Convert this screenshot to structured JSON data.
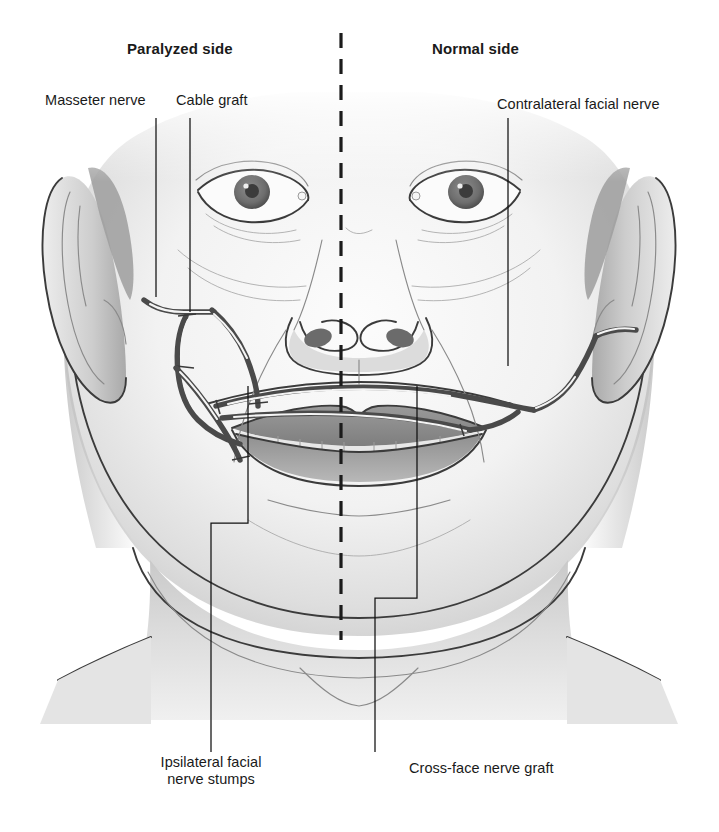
{
  "figure": {
    "kind": "medical-illustration",
    "midline_label": "facial-midline-dashed"
  },
  "headings": {
    "left": "Paralyzed side",
    "right": "Normal side"
  },
  "labels": {
    "masseter_nerve": "Masseter nerve",
    "cable_graft": "Cable graft",
    "contralateral_facial_nerve": "Contralateral facial nerve",
    "ipsilateral_stumps_line1": "Ipsilateral facial",
    "ipsilateral_stumps_line2": "nerve stumps",
    "cross_face_graft": "Cross-face nerve graft"
  },
  "colors": {
    "ink": "#1a1a1a",
    "leader": "#111111",
    "midline": "#1b1b1b",
    "nerve": "#4a4a4a",
    "skin_light": "#f7f7f7",
    "skin_shade": "#c9c9c9",
    "lip": "#8d8d8d",
    "background": "#ffffff"
  },
  "anatomy": {
    "parts": [
      "left-ear",
      "right-ear",
      "left-eye",
      "right-eye",
      "nose",
      "upper-lip",
      "lower-lip",
      "teeth",
      "chin",
      "neck",
      "clavicle-left",
      "clavicle-right"
    ]
  },
  "annotation_lines": {
    "masseter_nerve": "straight vertical leader from label down to masseter nerve trunk",
    "cable_graft": "straight vertical leader from label down to cable graft segment",
    "contralateral_facial_nerve": "straight vertical leader down to contralateral facial nerve",
    "ipsilateral_stumps": "bracketed leader rising from label to two nerve stumps",
    "cross_face_graft": "bracketed leader rising from label to the crossing graft"
  }
}
